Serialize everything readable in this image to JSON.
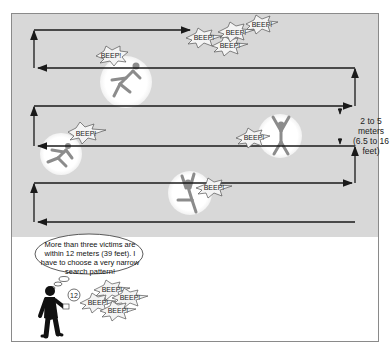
{
  "diagram": {
    "type": "search-pattern",
    "spacing_label": {
      "line1": "2 to 5 meters",
      "line2": "(6.5 to 16 feet)"
    },
    "speech_bubble": {
      "text": "More than three victims are within 12 meters (39 feet). I have to choose a very narrow search pattern!"
    },
    "device_reading": "12",
    "beep_label": "BEEP!",
    "colors": {
      "field": "#d8d8d8",
      "path": "#1a1a1a",
      "victim_glow": "#ffffff",
      "victim": "#8c8c8c",
      "rescuer": "#111111"
    },
    "victims": [
      {
        "name": "victim-1",
        "beeps": 1
      },
      {
        "name": "victim-2",
        "beeps": 1
      },
      {
        "name": "victim-3",
        "beeps": 1
      },
      {
        "name": "victim-4",
        "beeps": 1
      }
    ],
    "beep_clusters": [
      {
        "name": "top-cluster",
        "count": 4
      },
      {
        "name": "rescuer-cluster",
        "count": 4
      }
    ]
  }
}
